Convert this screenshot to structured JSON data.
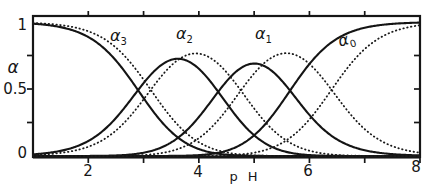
{
  "figure": {
    "background": "#ffffff",
    "ink_color": "#161616"
  },
  "chart_data": {
    "type": "line",
    "title": "",
    "xlabel": "p H",
    "ylabel": "α",
    "xlim": [
      1,
      8
    ],
    "ylim": [
      0,
      1
    ],
    "grid": false,
    "legend": "none (curves labeled inline)",
    "frame": "full box with outward ticks top/bottom/left and inward ticks right",
    "axes": {
      "x_ticks_bottom": [
        2,
        3,
        4,
        5,
        6,
        7,
        8
      ],
      "x_ticks_top": [
        2,
        3,
        4,
        5,
        6,
        7
      ],
      "x_tick_labels": [
        "2",
        "4",
        "6",
        "8"
      ],
      "x_tick_label_values": [
        2,
        4,
        6,
        8
      ],
      "y_ticks_side": [
        0.25,
        0.5,
        0.75
      ],
      "y_tick_labels": [
        "1",
        "0.5",
        "0"
      ],
      "y_tick_label_values": [
        1,
        0.5,
        0
      ]
    },
    "curve_labels": [
      {
        "base": "α",
        "sub": "3"
      },
      {
        "base": "α",
        "sub": "2"
      },
      {
        "base": "α",
        "sub": "1"
      },
      {
        "base": "α",
        "sub": "0"
      }
    ],
    "series": [
      {
        "name": "solid curve set",
        "style": "solid",
        "color": "#141414",
        "pKa": [
          2.9,
          4.35,
          5.65
        ],
        "curves": [
          {
            "label": "α3",
            "sub": 3,
            "samples_pH": [
              1,
              2,
              3,
              4,
              5,
              6,
              7,
              8
            ],
            "samples_alpha": [
              0.988,
              0.888,
              0.432,
              0.052,
              0.001,
              0.0,
              0.0,
              0.0
            ]
          },
          {
            "label": "α2",
            "sub": 2,
            "samples_pH": [
              1,
              2,
              3,
              4,
              5,
              6,
              7,
              8
            ],
            "samples_alpha": [
              0.012,
              0.112,
              0.544,
              0.651,
              0.154,
              0.007,
              0.0,
              0.0
            ]
          },
          {
            "label": "α1",
            "sub": 1,
            "samples_pH": [
              1,
              2,
              3,
              4,
              5,
              6,
              7,
              8
            ],
            "samples_alpha": [
              0.0,
              0.0,
              0.024,
              0.291,
              0.69,
              0.306,
              0.043,
              0.004
            ]
          },
          {
            "label": "α0",
            "sub": 0,
            "samples_pH": [
              1,
              2,
              3,
              4,
              5,
              6,
              7,
              8
            ],
            "samples_alpha": [
              0.0,
              0.0,
              0.0,
              0.007,
              0.155,
              0.687,
              0.957,
              0.996
            ]
          }
        ],
        "key_points": {
          "crossings_pH_at_alpha_0.5": [
            2.9,
            4.35,
            5.65
          ],
          "alpha2_peak": [
            3.63,
            0.73
          ],
          "alpha1_peak": [
            5.0,
            0.7
          ]
        }
      },
      {
        "name": "dotted curve set",
        "style": "dotted",
        "color": "#1a1a1a",
        "pKa": [
          3.13,
          4.76,
          6.4
        ],
        "curves": [
          {
            "label": "α3",
            "sub": 3,
            "samples_pH": [
              1,
              2,
              3,
              4,
              5,
              6,
              7,
              8
            ],
            "samples_alpha": [
              0.993,
              0.931,
              0.57,
              0.103,
              0.005,
              0.0,
              0.0,
              0.0
            ]
          },
          {
            "label": "α2",
            "sub": 2,
            "samples_pH": [
              1,
              2,
              3,
              4,
              5,
              6,
              7,
              8
            ],
            "samples_alpha": [
              0.007,
              0.069,
              0.423,
              0.764,
              0.355,
              0.04,
              0.001,
              0.0
            ]
          },
          {
            "label": "α1",
            "sub": 1,
            "samples_pH": [
              1,
              2,
              3,
              4,
              5,
              6,
              7,
              8
            ],
            "samples_alpha": [
              0.0,
              0.0,
              0.007,
              0.133,
              0.616,
              0.687,
              0.2,
              0.025
            ]
          },
          {
            "label": "α0",
            "sub": 0,
            "samples_pH": [
              1,
              2,
              3,
              4,
              5,
              6,
              7,
              8
            ],
            "samples_alpha": [
              0.0,
              0.0,
              0.0,
              0.001,
              0.025,
              0.273,
              0.798,
              0.975
            ]
          }
        ],
        "key_points": {
          "crossings_pH_at_alpha_0.5": [
            3.13,
            4.76,
            6.4
          ],
          "alpha2_peak": [
            3.95,
            0.77
          ],
          "alpha1_peak": [
            5.58,
            0.77
          ]
        }
      }
    ]
  }
}
